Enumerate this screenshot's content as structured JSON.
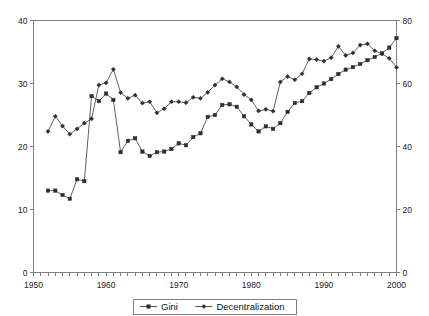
{
  "chart_data": {
    "type": "line",
    "title": "",
    "subtitle": "",
    "xlabel": "",
    "ylabel": "",
    "y2label": "",
    "grid": false,
    "legend_position": "bottom",
    "xlim": [
      1950,
      2000
    ],
    "ylim": [
      0,
      40
    ],
    "y2lim": [
      0,
      80
    ],
    "x_ticks": [
      1950,
      1960,
      1970,
      1980,
      1990,
      2000
    ],
    "x_tick_labels": [
      "1950",
      "1960",
      "1970",
      "1980",
      "1990",
      "2000"
    ],
    "x_minor_tick_interval": 1,
    "y_ticks": [
      0,
      10,
      20,
      30,
      40
    ],
    "y_tick_labels": [
      "0",
      "10",
      "20",
      "30",
      "40"
    ],
    "y2_ticks": [
      0,
      20,
      40,
      60,
      80
    ],
    "y2_tick_labels": [
      "0",
      "20",
      "40",
      "60",
      "80"
    ],
    "x": [
      1952,
      1953,
      1954,
      1955,
      1956,
      1957,
      1958,
      1959,
      1960,
      1961,
      1962,
      1963,
      1964,
      1965,
      1966,
      1967,
      1968,
      1969,
      1970,
      1971,
      1972,
      1973,
      1974,
      1975,
      1976,
      1977,
      1978,
      1979,
      1980,
      1981,
      1982,
      1983,
      1984,
      1985,
      1986,
      1987,
      1988,
      1989,
      1990,
      1991,
      1992,
      1993,
      1994,
      1995,
      1996,
      1997,
      1998,
      1999,
      2000
    ],
    "series": [
      {
        "name": "Gini",
        "axis": "left",
        "marker": "square",
        "values": [
          13.0,
          13.0,
          12.3,
          11.7,
          14.8,
          14.5,
          28.0,
          27.2,
          28.4,
          27.4,
          19.1,
          20.9,
          21.3,
          19.2,
          18.5,
          19.1,
          19.2,
          19.6,
          20.5,
          20.2,
          21.5,
          22.1,
          24.7,
          25.0,
          26.6,
          26.7,
          26.3,
          24.8,
          23.5,
          22.4,
          23.2,
          22.8,
          23.7,
          25.5,
          26.9,
          27.2,
          28.5,
          29.4,
          30.0,
          30.7,
          31.5,
          32.2,
          32.6,
          33.1,
          33.7,
          34.2,
          34.8,
          35.7,
          37.2
        ]
      },
      {
        "name": "Decentralization",
        "axis": "right",
        "marker": "diamond",
        "values": [
          44.8,
          49.6,
          46.5,
          43.9,
          45.6,
          47.4,
          48.8,
          59.5,
          60.2,
          64.5,
          57.1,
          55.3,
          56.3,
          53.8,
          54.2,
          50.7,
          52.0,
          54.2,
          54.2,
          53.9,
          55.6,
          55.3,
          57.2,
          59.5,
          61.5,
          60.5,
          58.9,
          56.5,
          54.8,
          51.3,
          51.8,
          51.2,
          60.5,
          62.2,
          61.2,
          63.1,
          67.8,
          67.6,
          67.1,
          68.2,
          71.8,
          68.9,
          69.7,
          72.2,
          72.6,
          70.4,
          69.4,
          68.0,
          65.1
        ]
      }
    ]
  },
  "legend": {
    "entries": [
      {
        "label": "Gini",
        "marker": "square"
      },
      {
        "label": "Decentralization",
        "marker": "diamond"
      }
    ]
  }
}
